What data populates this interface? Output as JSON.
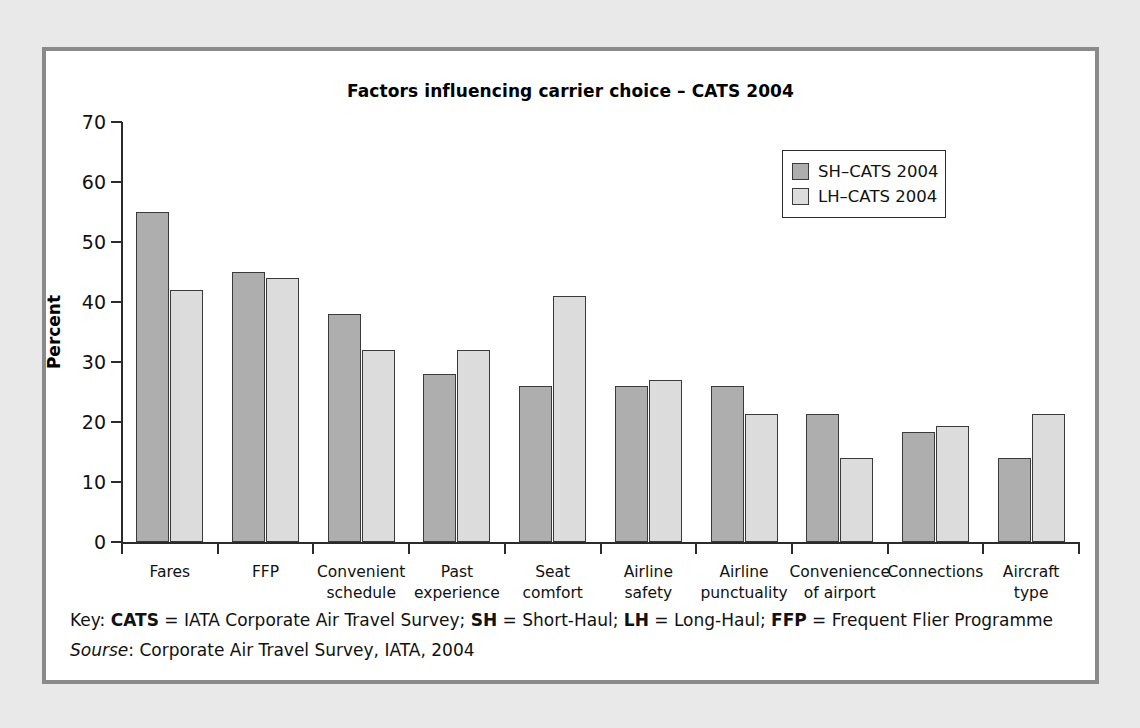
{
  "figure": {
    "title": "Factors influencing carrier choice  –  CATS 2004",
    "footnote_key_prefix": "Key: ",
    "footnote_key": "CATS = IATA Corporate Air Travel Survey; SH = Short-Haul; LH = Long-Haul; FFP = Frequent Flier Programme",
    "footnote_source_label": "Sourse",
    "footnote_source": ": Corporate Air Travel Survey, IATA, 2004",
    "key_terms": {
      "cats": "CATS",
      "cats_def": " = IATA Corporate Air Travel Survey; ",
      "sh": "SH",
      "sh_def": " = Short-Haul; ",
      "lh": "LH",
      "lh_def": " = Long-Haul; ",
      "ffp": "FFP",
      "ffp_def": " = Frequent Flier Programme"
    },
    "colors": {
      "series_sh": "#aeaeae",
      "series_lh": "#dcdcdc",
      "outline": "#3a3a3a",
      "axis": "#2b2b2b",
      "panel_background": "#ffffff",
      "page_background": "#e9e9e9",
      "frame_border": "#8a8a8a"
    }
  },
  "chart_data": {
    "type": "bar",
    "title": "Factors influencing carrier choice  –  CATS 2004",
    "xlabel": "",
    "ylabel": "Percent",
    "ylim": [
      0,
      70
    ],
    "ytick_step": 10,
    "yticks": [
      0,
      10,
      20,
      30,
      40,
      50,
      60,
      70
    ],
    "ytick_labels": [
      "0",
      "10",
      "20",
      "30",
      "40",
      "50",
      "60",
      "70"
    ],
    "grid": false,
    "legend_position": "upper right",
    "categories": [
      "Fares",
      "FFP",
      "Convenient\nschedule",
      "Past\nexperience",
      "Seat\ncomfort",
      "Airline\nsafety",
      "Airline\npunctuality",
      "Convenience\nof airport",
      "Connections",
      "Aircraft\ntype"
    ],
    "series": [
      {
        "name": "SH–CATS 2004",
        "color": "#aeaeae",
        "values": [
          55,
          45,
          38,
          28,
          26,
          26,
          26,
          21.3,
          18.3,
          14
        ]
      },
      {
        "name": "LH–CATS 2004",
        "color": "#dcdcdc",
        "values": [
          42,
          44,
          32,
          32,
          41,
          27,
          21.3,
          14,
          19.3,
          21.3
        ]
      }
    ]
  }
}
